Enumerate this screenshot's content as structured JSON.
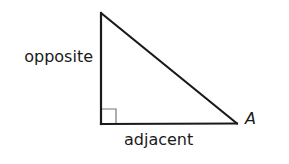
{
  "diagram": {
    "type": "right-triangle",
    "vertices": {
      "top": {
        "x": 101,
        "y": 13
      },
      "right_angle": {
        "x": 101,
        "y": 124
      },
      "angle_A": {
        "x": 237,
        "y": 123
      }
    },
    "right_angle_marker_size": 15,
    "stroke_color": "#1a1a1a",
    "marker_color": "#777777",
    "labels": {
      "opposite": "opposite",
      "adjacent": "adjacent",
      "vertex_A": "A"
    }
  }
}
